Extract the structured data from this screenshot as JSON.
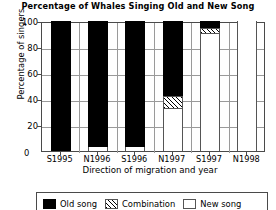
{
  "chart_data": {
    "type": "bar",
    "stacked": true,
    "title": "Percentage of Whales Singing Old and New Song",
    "xlabel": "Direction of migration and year",
    "ylabel": "Percentage of singers",
    "categories": [
      "S1995",
      "N1996",
      "S1996",
      "N1997",
      "S1997",
      "N1998"
    ],
    "ylim": [
      0,
      100
    ],
    "yticks": [
      0,
      20,
      40,
      60,
      80,
      100
    ],
    "ytick_labels": [
      "0",
      "20",
      "40",
      "60",
      "80",
      "100"
    ],
    "grid": true,
    "legend_position": "bottom",
    "series": [
      {
        "name": "Old song",
        "fill": "solid-black",
        "color": "#000000",
        "values": [
          100,
          97,
          97,
          58,
          5,
          0
        ]
      },
      {
        "name": "Combination",
        "fill": "hatched",
        "color": "#ffffff",
        "values": [
          0,
          0,
          0,
          10,
          5,
          0
        ]
      },
      {
        "name": "New song",
        "fill": "white",
        "color": "#ffffff",
        "values": [
          0,
          3,
          3,
          32,
          90,
          100
        ]
      }
    ]
  },
  "legend": {
    "items": [
      {
        "label": "Old song",
        "swatch": "solid-black-swatch"
      },
      {
        "label": "Combination",
        "swatch": "hatched-swatch"
      },
      {
        "label": "New song",
        "swatch": "white-swatch"
      }
    ]
  }
}
